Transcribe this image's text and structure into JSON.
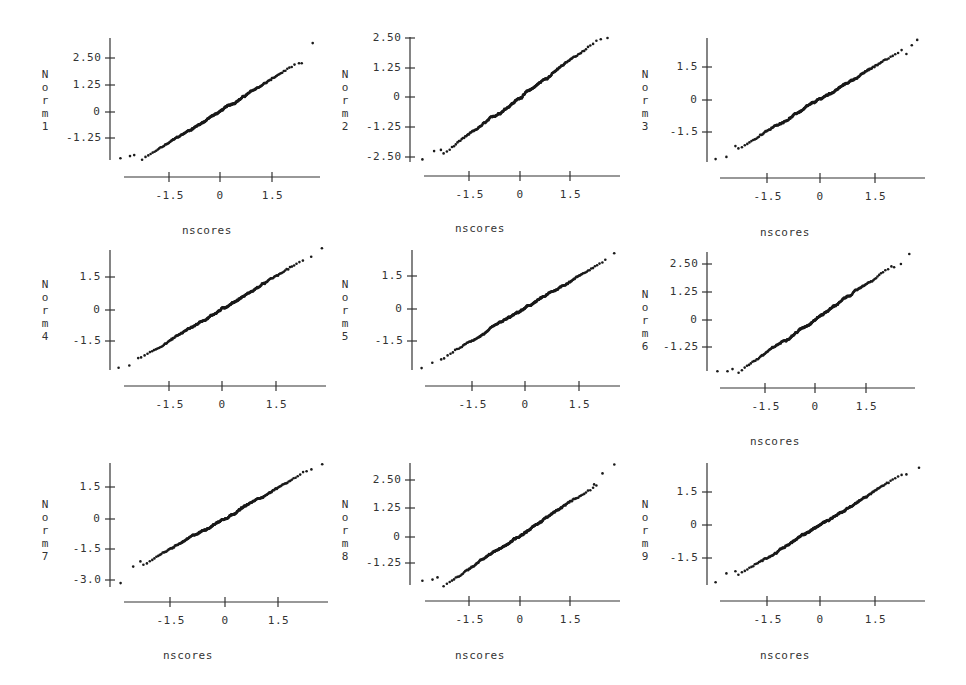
{
  "chart_data": [
    {
      "type": "scatter",
      "title": "",
      "xlabel": "nscores",
      "ylabel": "Norm1",
      "show_xlabel": true,
      "xticks": [
        -1.5,
        0,
        1.5
      ],
      "yticks": [
        2.5,
        1.25,
        0,
        -1.25
      ],
      "ytick_labels": [
        "2.50",
        "1.25",
        "0",
        "-1.25"
      ],
      "xlim": [
        -2.95,
        2.85
      ],
      "grid": false,
      "frame": {
        "yaxis_x": 110,
        "yaxis_top": 38,
        "yaxis_bottom": 160,
        "xaxis_y": 177,
        "xaxis_left": 124,
        "xaxis_right": 320,
        "xtick_px": [
          169,
          220,
          272
        ],
        "ytick_px": [
          58,
          85,
          112,
          138
        ],
        "xlabel_pos": [
          182,
          225
        ],
        "ylabel_pos": [
          40,
          100
        ]
      },
      "fit": {
        "slope": 1.0,
        "intercept": 0.0,
        "n": 300,
        "x_range": [
          -2.9,
          2.55
        ]
      },
      "tail_points": [
        [
          -2.9,
          -2.2
        ],
        [
          -2.62,
          -2.1
        ],
        [
          -2.5,
          -2.05
        ],
        [
          2.3,
          2.25
        ],
        [
          2.38,
          2.25
        ],
        [
          2.7,
          3.2
        ]
      ]
    },
    {
      "type": "scatter",
      "title": "",
      "xlabel": "nscores",
      "ylabel": "Norm2",
      "show_xlabel": true,
      "xticks": [
        -1.5,
        0,
        1.5
      ],
      "yticks": [
        2.5,
        1.25,
        0,
        -1.25,
        -2.5
      ],
      "ytick_labels": [
        "2.50",
        "1.25",
        "0",
        "-1.25",
        "-2.50"
      ],
      "xlim": [
        -2.95,
        2.85
      ],
      "grid": false,
      "frame": {
        "yaxis_x": 410,
        "yaxis_top": 37,
        "yaxis_bottom": 162,
        "xaxis_y": 176,
        "xaxis_left": 424,
        "xaxis_right": 620,
        "xtick_px": [
          469,
          520,
          570
        ],
        "ytick_px": [
          38,
          68,
          97,
          127,
          157
        ],
        "xlabel_pos": [
          455,
          223
        ],
        "ylabel_pos": [
          340,
          100
        ]
      },
      "fit": {
        "slope": 1.05,
        "intercept": 0.0,
        "n": 300,
        "x_range": [
          -2.9,
          2.6
        ]
      },
      "tail_points": [
        [
          -2.9,
          -2.6
        ],
        [
          -2.55,
          -2.25
        ],
        [
          -2.35,
          -2.2
        ],
        [
          2.4,
          2.45
        ],
        [
          2.6,
          2.5
        ]
      ]
    },
    {
      "type": "scatter",
      "title": "",
      "xlabel": "nscores",
      "ylabel": "Norm3",
      "show_xlabel": true,
      "xticks": [
        -1.5,
        0,
        1.5
      ],
      "yticks": [
        1.5,
        0,
        -1.5
      ],
      "ytick_labels": [
        "1.5",
        "0",
        "-1.5"
      ],
      "xlim": [
        -2.95,
        2.85
      ],
      "grid": false,
      "frame": {
        "yaxis_x": 707,
        "yaxis_top": 38,
        "yaxis_bottom": 162,
        "xaxis_y": 178,
        "xaxis_left": 720,
        "xaxis_right": 925,
        "xtick_px": [
          767,
          820,
          875
        ],
        "ytick_px": [
          67,
          100,
          132
        ],
        "xlabel_pos": [
          760,
          227
        ],
        "ylabel_pos": [
          640,
          100
        ]
      },
      "fit": {
        "slope": 1.0,
        "intercept": 0.0,
        "n": 300,
        "x_range": [
          -2.9,
          2.7
        ]
      },
      "tail_points": [
        [
          -2.9,
          -2.75
        ],
        [
          -2.6,
          -2.65
        ],
        [
          -2.35,
          -2.15
        ],
        [
          2.4,
          2.1
        ],
        [
          2.55,
          2.5
        ],
        [
          2.7,
          2.75
        ]
      ]
    },
    {
      "type": "scatter",
      "title": "",
      "xlabel": "nscores",
      "ylabel": "Norm4",
      "show_xlabel": false,
      "xticks": [
        -1.5,
        0,
        1.5
      ],
      "yticks": [
        1.5,
        0,
        -1.5
      ],
      "ytick_labels": [
        "1.5",
        "0",
        "-1.5"
      ],
      "xlim": [
        -2.95,
        2.85
      ],
      "grid": false,
      "frame": {
        "yaxis_x": 110,
        "yaxis_top": 250,
        "yaxis_bottom": 370,
        "xaxis_y": 386,
        "xaxis_left": 124,
        "xaxis_right": 326,
        "xtick_px": [
          169,
          222,
          276
        ],
        "ytick_px": [
          277,
          310,
          341
        ],
        "xlabel_pos": null,
        "ylabel_pos": [
          40,
          310
        ]
      },
      "fit": {
        "slope": 1.0,
        "intercept": 0.0,
        "n": 300,
        "x_range": [
          -2.9,
          2.8
        ]
      },
      "tail_points": [
        [
          -2.9,
          -2.75
        ],
        [
          -2.6,
          -2.65
        ],
        [
          -2.35,
          -2.3
        ],
        [
          2.5,
          2.45
        ],
        [
          2.8,
          2.85
        ]
      ]
    },
    {
      "type": "scatter",
      "title": "",
      "xlabel": "nscores",
      "ylabel": "Norm5",
      "show_xlabel": false,
      "xticks": [
        -1.5,
        0,
        1.5
      ],
      "yticks": [
        1.5,
        0,
        -1.5
      ],
      "ytick_labels": [
        "1.5",
        "0",
        "-1.5"
      ],
      "xlim": [
        -2.95,
        2.85
      ],
      "grid": false,
      "frame": {
        "yaxis_x": 412,
        "yaxis_top": 250,
        "yaxis_bottom": 370,
        "xaxis_y": 386,
        "xaxis_left": 425,
        "xaxis_right": 620,
        "xtick_px": [
          472,
          525,
          579
        ],
        "ytick_px": [
          276,
          309,
          341
        ],
        "xlabel_pos": null,
        "ylabel_pos": [
          340,
          310
        ]
      },
      "fit": {
        "slope": 1.0,
        "intercept": 0.0,
        "n": 300,
        "x_range": [
          -2.9,
          2.5
        ]
      },
      "tail_points": [
        [
          -2.9,
          -2.75
        ],
        [
          -2.6,
          -2.5
        ],
        [
          -2.35,
          -2.35
        ],
        [
          2.25,
          2.25
        ],
        [
          2.5,
          2.55
        ]
      ]
    },
    {
      "type": "scatter",
      "title": "",
      "xlabel": "nscores",
      "ylabel": "Norm6",
      "show_xlabel": true,
      "xticks": [
        -1.5,
        0,
        1.5
      ],
      "yticks": [
        2.5,
        1.25,
        0,
        -1.25
      ],
      "ytick_labels": [
        "2.50",
        "1.25",
        "0",
        "-1.25"
      ],
      "xlim": [
        -2.95,
        2.85
      ],
      "grid": false,
      "frame": {
        "yaxis_x": 707,
        "yaxis_top": 252,
        "yaxis_bottom": 371,
        "xaxis_y": 388,
        "xaxis_left": 720,
        "xaxis_right": 915,
        "xtick_px": [
          765,
          815,
          866
        ],
        "ytick_px": [
          264,
          292,
          320,
          347
        ],
        "xlabel_pos": [
          750,
          436
        ],
        "ylabel_pos": [
          640,
          320
        ]
      },
      "fit": {
        "slope": 1.05,
        "intercept": 0.0,
        "n": 300,
        "x_range": [
          -2.9,
          2.8
        ]
      },
      "tail_points": [
        [
          -2.9,
          -2.35
        ],
        [
          -2.6,
          -2.35
        ],
        [
          -2.45,
          -2.25
        ],
        [
          2.35,
          2.35
        ],
        [
          2.55,
          2.5
        ],
        [
          2.8,
          2.95
        ]
      ]
    },
    {
      "type": "scatter",
      "title": "",
      "xlabel": "nscores",
      "ylabel": "Norm7",
      "show_xlabel": true,
      "xticks": [
        -1.5,
        0,
        1.5
      ],
      "yticks": [
        1.5,
        0,
        -1.5,
        -3.0
      ],
      "ytick_labels": [
        "1.5",
        "0",
        "-1.5",
        "-3.0"
      ],
      "xlim": [
        -2.95,
        2.85
      ],
      "grid": false,
      "frame": {
        "yaxis_x": 110,
        "yaxis_top": 463,
        "yaxis_bottom": 587,
        "xaxis_y": 602,
        "xaxis_left": 124,
        "xaxis_right": 328,
        "xtick_px": [
          170,
          225,
          278
        ],
        "ytick_px": [
          487,
          519,
          549,
          580
        ],
        "xlabel_pos": [
          163,
          650
        ],
        "ylabel_pos": [
          40,
          530
        ]
      },
      "fit": {
        "slope": 1.0,
        "intercept": 0.0,
        "n": 300,
        "x_range": [
          -2.9,
          2.7
        ]
      },
      "tail_points": [
        [
          -2.9,
          -3.15
        ],
        [
          -2.55,
          -2.35
        ],
        [
          -2.35,
          -2.1
        ],
        [
          2.4,
          2.35
        ],
        [
          2.7,
          2.6
        ]
      ]
    },
    {
      "type": "scatter",
      "title": "",
      "xlabel": "nscores",
      "ylabel": "Norm8",
      "show_xlabel": true,
      "xticks": [
        -1.5,
        0,
        1.5
      ],
      "yticks": [
        2.5,
        1.25,
        0,
        -1.25
      ],
      "ytick_labels": [
        "2.50",
        "1.25",
        "0",
        "-1.25"
      ],
      "xlim": [
        -2.95,
        2.85
      ],
      "grid": false,
      "frame": {
        "yaxis_x": 410,
        "yaxis_top": 463,
        "yaxis_bottom": 585,
        "xaxis_y": 601,
        "xaxis_left": 425,
        "xaxis_right": 620,
        "xtick_px": [
          469,
          520,
          570
        ],
        "ytick_px": [
          480,
          508,
          537,
          563
        ],
        "xlabel_pos": [
          455,
          650
        ],
        "ylabel_pos": [
          340,
          530
        ]
      },
      "fit": {
        "slope": 1.0,
        "intercept": 0.0,
        "n": 300,
        "x_range": [
          -2.9,
          2.8
        ]
      },
      "tail_points": [
        [
          -2.9,
          -2.05
        ],
        [
          -2.6,
          -2.0
        ],
        [
          -2.45,
          -1.9
        ],
        [
          2.2,
          2.3
        ],
        [
          2.45,
          2.8
        ],
        [
          2.8,
          3.2
        ]
      ]
    },
    {
      "type": "scatter",
      "title": "",
      "xlabel": "nscores",
      "ylabel": "Norm9",
      "show_xlabel": true,
      "xticks": [
        -1.5,
        0,
        1.5
      ],
      "yticks": [
        1.5,
        0,
        -1.5
      ],
      "ytick_labels": [
        "1.5",
        "0",
        "-1.5"
      ],
      "xlim": [
        -2.95,
        2.85
      ],
      "grid": false,
      "frame": {
        "yaxis_x": 707,
        "yaxis_top": 463,
        "yaxis_bottom": 585,
        "xaxis_y": 601,
        "xaxis_left": 720,
        "xaxis_right": 925,
        "xtick_px": [
          767,
          820,
          875
        ],
        "ytick_px": [
          492,
          525,
          558
        ],
        "xlabel_pos": [
          760,
          650
        ],
        "ylabel_pos": [
          640,
          530
        ]
      },
      "fit": {
        "slope": 1.0,
        "intercept": 0.0,
        "n": 300,
        "x_range": [
          -2.9,
          2.75
        ]
      },
      "tail_points": [
        [
          -2.9,
          -2.6
        ],
        [
          -2.6,
          -2.2
        ],
        [
          -2.35,
          -2.1
        ],
        [
          2.4,
          2.3
        ],
        [
          2.75,
          2.6
        ]
      ]
    }
  ],
  "style": {
    "ink": "#1a1a1a",
    "axis": "#333333",
    "background": "#ffffff"
  }
}
